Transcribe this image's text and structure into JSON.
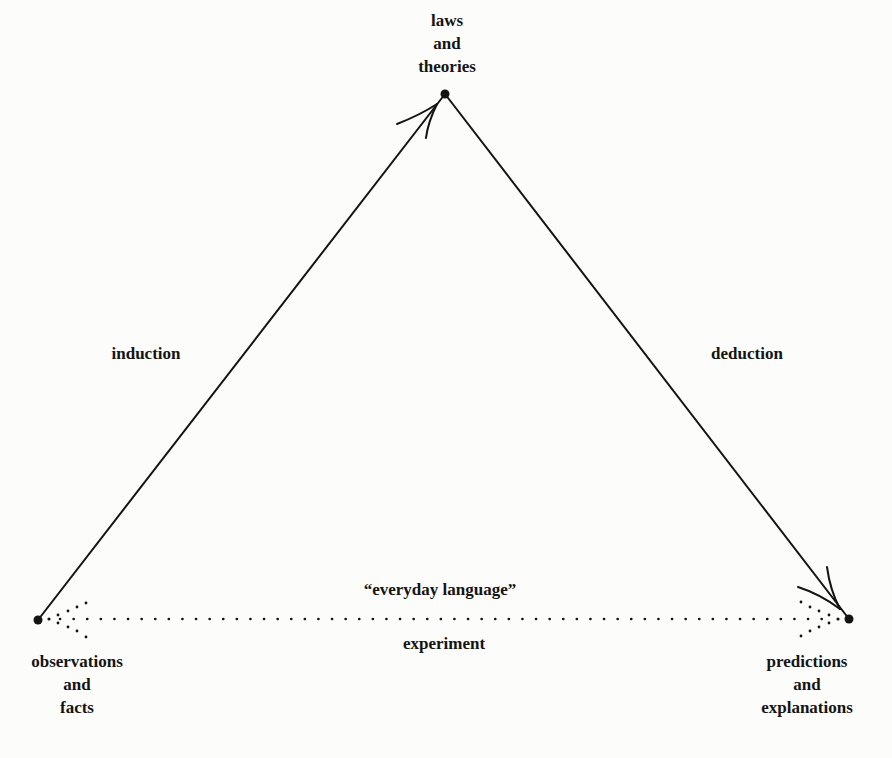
{
  "nodes": {
    "top": {
      "lines": [
        "laws",
        "and",
        "theories"
      ],
      "x": 445,
      "y": 94
    },
    "left": {
      "lines": [
        "observations",
        "and",
        "facts"
      ],
      "x": 38,
      "y": 620
    },
    "right": {
      "lines": [
        "predictions",
        "and",
        "explanations"
      ],
      "x": 849,
      "y": 619
    }
  },
  "edges": {
    "induction": {
      "label": "induction",
      "from": "observations and facts",
      "to": "laws and theories",
      "style": "solid-arrow"
    },
    "deduction": {
      "label": "deduction",
      "from": "laws and theories",
      "to": "predictions and explanations",
      "style": "solid-arrow"
    },
    "bottom": {
      "label_above": "“everyday language”",
      "label_below": "experiment",
      "style": "dotted-double-arrow"
    }
  },
  "colors": {
    "ink": "#141414",
    "background": "#fcfcfa"
  }
}
